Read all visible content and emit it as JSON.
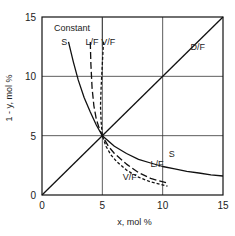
{
  "chart_data": {
    "type": "line",
    "title": "",
    "xlabel": "x, mol %",
    "ylabel": "1 - y, mol %",
    "xlim": [
      0,
      15
    ],
    "ylim": [
      0,
      15
    ],
    "xticks": [
      0,
      5,
      10,
      15
    ],
    "yticks": [
      0,
      5,
      10,
      15
    ],
    "grid": true,
    "legend_header": "Constant",
    "series": [
      {
        "name": "D/F",
        "style": "solid",
        "x": [
          0,
          15
        ],
        "y": [
          0,
          15
        ]
      },
      {
        "name": "S",
        "style": "solid",
        "x": [
          2.2,
          2.6,
          3.0,
          3.5,
          4.0,
          4.5,
          5.0,
          6.0,
          7.0,
          8.0,
          9.0,
          10.0,
          11.0,
          12.0,
          13.0,
          14.0,
          15.0
        ],
        "y": [
          12.9,
          11.2,
          9.7,
          8.2,
          7.0,
          5.9,
          5.0,
          4.1,
          3.5,
          3.0,
          2.7,
          2.4,
          2.2,
          2.0,
          1.85,
          1.7,
          1.6
        ]
      },
      {
        "name": "L/F",
        "style": "dashed",
        "x": [
          4.0,
          4.05,
          4.15,
          4.3,
          4.5,
          4.75,
          5.0,
          5.5,
          6.0,
          7.0,
          8.0,
          9.0,
          10.4
        ],
        "y": [
          12.9,
          11.0,
          9.0,
          7.5,
          6.4,
          5.6,
          5.0,
          4.1,
          3.5,
          2.6,
          1.9,
          1.4,
          1.0
        ]
      },
      {
        "name": "V/F",
        "style": "short-dashed",
        "x": [
          5.1,
          5.0,
          4.9,
          4.85,
          4.9,
          5.0,
          5.3,
          5.7,
          6.2,
          7.0,
          8.0,
          9.0,
          10.4
        ],
        "y": [
          12.9,
          11.0,
          9.0,
          7.5,
          6.2,
          5.0,
          4.1,
          3.4,
          2.8,
          2.1,
          1.5,
          1.1,
          0.75
        ]
      }
    ],
    "annotations": [
      {
        "text": "Constant",
        "x": 1.0,
        "y": 13.8
      },
      {
        "text": "S",
        "x": 1.6,
        "y": 12.6
      },
      {
        "text": "L/F",
        "x": 3.6,
        "y": 12.6
      },
      {
        "text": "V/F",
        "x": 4.9,
        "y": 12.6
      },
      {
        "text": "D/F",
        "x": 12.3,
        "y": 12.2
      },
      {
        "text": "S",
        "x": 10.5,
        "y": 3.2
      },
      {
        "text": "L/F",
        "x": 9.0,
        "y": 2.4
      },
      {
        "text": "V/F",
        "x": 6.7,
        "y": 1.3
      }
    ]
  }
}
